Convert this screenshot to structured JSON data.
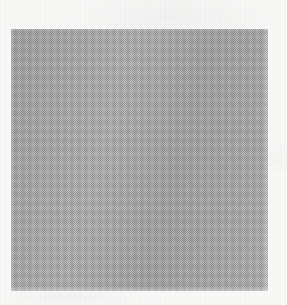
{
  "image": {
    "kind": "scanned-blank-plate",
    "width": 287,
    "height": 305,
    "background_color": "#f8f8f7",
    "has_text": false,
    "has_icons": false,
    "caption": ""
  },
  "plate": {
    "label": "",
    "fill_color": "#a8a8a8",
    "x": 11,
    "y": 29,
    "width": 257,
    "height": 262,
    "texture": "checkerboard-dither",
    "content": ""
  },
  "margins": {
    "note": "",
    "top": 29,
    "left": 11,
    "right": 19,
    "bottom": 14
  }
}
